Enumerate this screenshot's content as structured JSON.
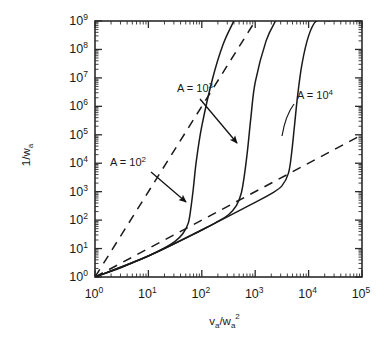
{
  "chart_data": {
    "type": "line",
    "title": "",
    "xlabel": "v_a/w_a^2",
    "ylabel": "1/w_a",
    "xscale": "log",
    "yscale": "log",
    "xlim": [
      1,
      100000
    ],
    "ylim": [
      1,
      1000000000
    ],
    "grid": false,
    "legend": "none",
    "x_tick_labels": [
      "10^0",
      "10^1",
      "10^2",
      "10^3",
      "10^4",
      "10^5"
    ],
    "y_tick_labels": [
      "10^0",
      "10^1",
      "10^2",
      "10^3",
      "10^4",
      "10^5",
      "10^6",
      "10^7",
      "10^8",
      "10^9"
    ],
    "x_tick_exponents": [
      "0",
      "1",
      "2",
      "3",
      "4",
      "5"
    ],
    "y_tick_exponents": [
      "0",
      "1",
      "2",
      "3",
      "4",
      "5",
      "6",
      "7",
      "8",
      "9"
    ],
    "series": [
      {
        "name": "A = 10^2",
        "style": "solid",
        "points": [
          [
            1,
            1
          ],
          [
            3.2,
            2.2
          ],
          [
            10,
            5.5
          ],
          [
            20,
            10.5
          ],
          [
            31.6,
            18
          ],
          [
            44,
            33
          ],
          [
            56,
            80
          ],
          [
            63,
            300
          ],
          [
            70,
            1500
          ],
          [
            79,
            12000
          ],
          [
            100,
            200000
          ],
          [
            158,
            9000000
          ],
          [
            250,
            150000000
          ],
          [
            398,
            1000000000
          ]
        ]
      },
      {
        "name": "A = 10^3",
        "style": "solid",
        "points": [
          [
            1,
            1
          ],
          [
            10,
            5.5
          ],
          [
            100,
            45
          ],
          [
            200,
            90
          ],
          [
            316,
            155
          ],
          [
            447,
            330
          ],
          [
            550,
            900
          ],
          [
            630,
            4000
          ],
          [
            720,
            30000
          ],
          [
            830,
            400000
          ],
          [
            1000,
            7000000
          ],
          [
            1600,
            200000000
          ],
          [
            2400,
            1000000000
          ]
        ]
      },
      {
        "name": "A = 10^4",
        "style": "solid",
        "points": [
          [
            1,
            1
          ],
          [
            10,
            5.5
          ],
          [
            100,
            45
          ],
          [
            1000,
            420
          ],
          [
            2000,
            850
          ],
          [
            3160,
            1600
          ],
          [
            4200,
            4500
          ],
          [
            4800,
            22000
          ],
          [
            5400,
            180000
          ],
          [
            6200,
            2200000
          ],
          [
            7500,
            30000000
          ],
          [
            10000,
            300000000
          ],
          [
            14000,
            1000000000
          ],
          [
            25000,
            1000000000
          ]
        ]
      },
      {
        "name": "asymptote-steep",
        "style": "dashed",
        "points": [
          [
            1,
            1
          ],
          [
            1000,
            1000000000
          ]
        ]
      },
      {
        "name": "asymptote-shallow",
        "style": "dashed",
        "points": [
          [
            1,
            1
          ],
          [
            100000,
            100000
          ]
        ]
      }
    ],
    "annotations": [
      {
        "id": "anno-a2",
        "label_prefix": "A = 10",
        "label_exponent": "2",
        "text_x": 110,
        "text_y": 166,
        "arrow_from": [
          151,
          172
        ],
        "arrow_to": [
          186,
          202
        ]
      },
      {
        "id": "anno-a3",
        "label_prefix": "A = 10",
        "label_exponent": "3",
        "text_x": 177,
        "text_y": 92,
        "arrow_from": [
          200,
          99
        ],
        "arrow_to": [
          237,
          143
        ]
      },
      {
        "id": "anno-a4",
        "label_prefix": "A = 10",
        "label_exponent": "4",
        "text_x": 297,
        "text_y": 99,
        "arrow_from": null,
        "arrow_to": null
      }
    ]
  },
  "axes": {
    "x_label_base": "v",
    "x_label_sub1": "a",
    "x_label_slash": "/w",
    "x_label_sub2": "a",
    "x_label_sup": "2",
    "y_label_base": "1/w",
    "y_label_sub": "a"
  }
}
